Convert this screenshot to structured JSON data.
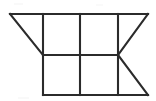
{
  "canvas": {
    "width": 156,
    "height": 101,
    "background_color": "#ffffff",
    "description": "Black line geometric figure: a horizontal band divided into rectangles with triangular wedges on the left and right"
  },
  "figure": {
    "stroke_color": "#2b2b2b",
    "stroke_width": 2.1,
    "shape_summary": "Trapezoid-like outline with internal grid: top edge spans the full width, a left diagonal descends to the mid-left, the lower half is a rectangle, and a right-pointing chevron closes the right end",
    "vertices": {
      "top_left": [
        10,
        14
      ],
      "top_right": [
        148,
        14
      ],
      "mid_left": [
        43,
        55
      ],
      "mid_right": [
        118,
        55
      ],
      "bottom_left": [
        43,
        95
      ],
      "bottom_right": [
        148,
        95
      ]
    },
    "segments": [
      {
        "name": "top-edge",
        "x1": 10,
        "y1": 14,
        "x2": 148,
        "y2": 14,
        "kind": "horizontal"
      },
      {
        "name": "middle-horizontal",
        "x1": 43,
        "y1": 55,
        "x2": 118,
        "y2": 55,
        "kind": "horizontal"
      },
      {
        "name": "bottom-edge",
        "x1": 43,
        "y1": 95,
        "x2": 148,
        "y2": 95,
        "kind": "horizontal"
      },
      {
        "name": "vertical-left",
        "x1": 43,
        "y1": 14,
        "x2": 43,
        "y2": 95,
        "kind": "vertical"
      },
      {
        "name": "vertical-center",
        "x1": 80,
        "y1": 14,
        "x2": 80,
        "y2": 95,
        "kind": "vertical"
      },
      {
        "name": "vertical-right",
        "x1": 118,
        "y1": 14,
        "x2": 118,
        "y2": 95,
        "kind": "vertical"
      },
      {
        "name": "diagonal-left-wedge",
        "x1": 10,
        "y1": 14,
        "x2": 43,
        "y2": 55,
        "kind": "diagonal"
      },
      {
        "name": "diagonal-right-upper",
        "x1": 148,
        "y1": 14,
        "x2": 118,
        "y2": 55,
        "kind": "diagonal"
      },
      {
        "name": "diagonal-right-lower",
        "x1": 118,
        "y1": 55,
        "x2": 148,
        "y2": 95,
        "kind": "diagonal"
      }
    ],
    "regions": [
      {
        "name": "left-triangle",
        "shape": "triangle"
      },
      {
        "name": "upper-left-rectangle",
        "shape": "rectangle"
      },
      {
        "name": "upper-right-rectangle",
        "shape": "rectangle"
      },
      {
        "name": "upper-right-triangle",
        "shape": "triangle"
      },
      {
        "name": "lower-left-rectangle",
        "shape": "rectangle"
      },
      {
        "name": "lower-right-rectangle",
        "shape": "rectangle"
      },
      {
        "name": "lower-right-triangle",
        "shape": "triangle"
      }
    ]
  },
  "labels": {
    "text_present": false,
    "items": []
  }
}
